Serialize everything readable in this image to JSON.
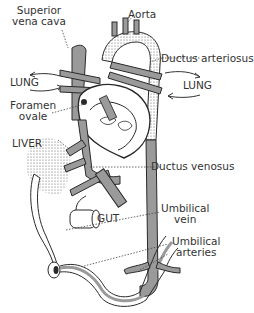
{
  "diagram": {
    "colors": {
      "vessel_fill": "#9a9a9a",
      "vessel_stroke": "#2a2a2a",
      "stipple": "#555555",
      "leader_line": "#444444",
      "label_text": "#333333",
      "background": "#ffffff"
    },
    "labels": {
      "superior_vena_cava_line1": "Superior",
      "superior_vena_cava_line2": "vena cava",
      "aorta": "Aorta",
      "ductus_arteriosus": "Ductus arteriosus",
      "lung_left": "LUNG",
      "lung_right": "LUNG",
      "foramen_ovale_line1": "Foramen",
      "foramen_ovale_line2": "ovale",
      "liver": "LIVER",
      "ductus_venosus": "Ductus venosus",
      "gut": "GUT",
      "umbilical_vein_line1": "Umbilical",
      "umbilical_vein_line2": "vein",
      "umbilical_arteries_line1": "Umbilical",
      "umbilical_arteries_line2": "arteries"
    }
  }
}
